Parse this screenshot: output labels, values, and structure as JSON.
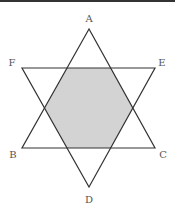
{
  "figure": {
    "colors": {
      "line": "#333333",
      "shade": "#d3d3d3",
      "label": "#555555",
      "top_rule": "#333333"
    },
    "vertices": {
      "A": {
        "label": "A",
        "x": 89,
        "y": 29
      },
      "B": {
        "label": "B",
        "x": 22,
        "y": 148
      },
      "C": {
        "label": "C",
        "x": 155,
        "y": 148
      },
      "D": {
        "label": "D",
        "x": 89,
        "y": 187
      },
      "E": {
        "label": "E",
        "x": 155,
        "y": 68
      },
      "F": {
        "label": "F",
        "x": 22,
        "y": 68
      }
    },
    "triangles": [
      {
        "name": "ABC",
        "points": "89,29 22,148 155,148"
      },
      {
        "name": "DEF",
        "points": "89,187 155,68 22,68"
      }
    ],
    "shaded_hexagon": {
      "points": "67,68 111,68 133,108 111,148 67,148 45,108"
    }
  }
}
